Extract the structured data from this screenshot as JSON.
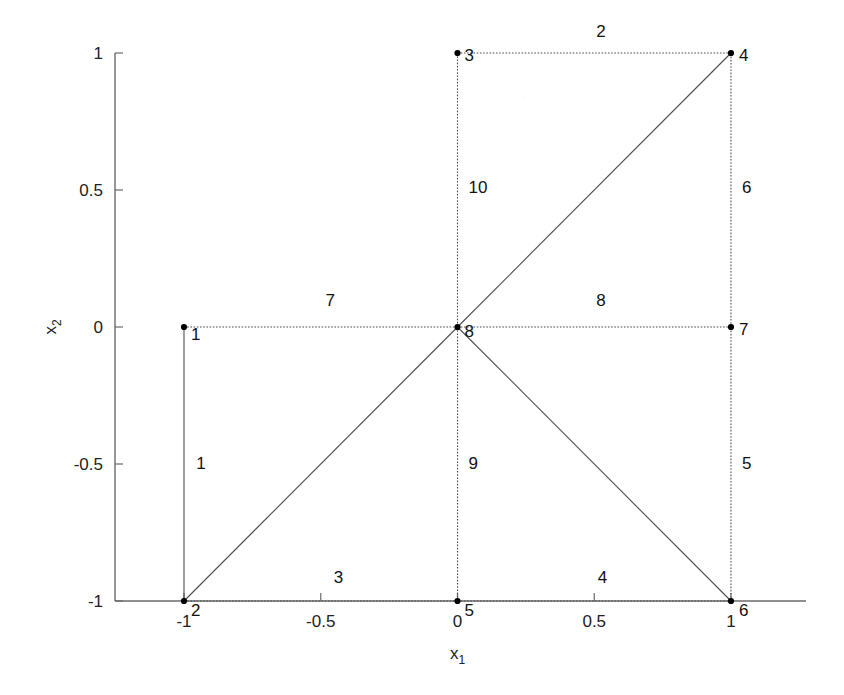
{
  "chart_data": {
    "type": "scatter",
    "title": "",
    "subtitle": "",
    "xlabel": "x_1",
    "ylabel": "x_2",
    "xlabel_base": "x",
    "xlabel_sub": "1",
    "ylabel_base": "x",
    "ylabel_sub": "2",
    "xlim": [
      -1.25,
      1.25
    ],
    "ylim": [
      -1.15,
      1.08
    ],
    "xticks": [
      -1,
      -0.5,
      0,
      0.5,
      1
    ],
    "xtick_labels": [
      "-1",
      "-0.5",
      "0",
      "0.5",
      "1"
    ],
    "yticks": [
      -1,
      -0.5,
      0,
      0.5,
      1
    ],
    "ytick_labels": [
      "-1",
      "-0.5",
      "0",
      "0.5",
      "1"
    ],
    "grid": false,
    "legend": "none",
    "nodes": [
      {
        "id": "1",
        "x": -1,
        "y": 0,
        "label": "1",
        "label_dx": 7,
        "label_dy": 13
      },
      {
        "id": "2",
        "x": -1,
        "y": -1,
        "label": "2",
        "label_dx": 7,
        "label_dy": 15
      },
      {
        "id": "3",
        "x": 0,
        "y": 1,
        "label": "3",
        "label_dx": 7,
        "label_dy": 8
      },
      {
        "id": "4",
        "x": 1,
        "y": 1,
        "label": "4",
        "label_dx": 8,
        "label_dy": 8
      },
      {
        "id": "5",
        "x": 0,
        "y": -1,
        "label": "5",
        "label_dx": 7,
        "label_dy": 15
      },
      {
        "id": "6",
        "x": 1,
        "y": -1,
        "label": "6",
        "label_dx": 8,
        "label_dy": 15
      },
      {
        "id": "7",
        "x": 1,
        "y": 0,
        "label": "7",
        "label_dx": 8,
        "label_dy": 8
      },
      {
        "id": "8",
        "x": 0,
        "y": 0,
        "label": "8",
        "label_dx": 7,
        "label_dy": 10
      }
    ],
    "edges": [
      {
        "label": "1",
        "from": "1",
        "to": "2",
        "style": "solid",
        "label_x": -0.955,
        "label_y": -0.52,
        "anchor": "start"
      },
      {
        "label": "2",
        "from": "3",
        "to": "4",
        "style": "dotted",
        "label_x": 0.525,
        "label_y": 1.06,
        "anchor": "middle"
      },
      {
        "label": "3",
        "from": "2",
        "to": "5",
        "style": "dotted",
        "label_x": -0.435,
        "label_y": -0.935,
        "anchor": "middle"
      },
      {
        "label": "4",
        "from": "5",
        "to": "6",
        "style": "dotted",
        "label_x": 0.53,
        "label_y": -0.935,
        "anchor": "middle"
      },
      {
        "label": "5",
        "from": "6",
        "to": "7",
        "style": "dotted",
        "label_x": 1.04,
        "label_y": -0.52,
        "anchor": "start"
      },
      {
        "label": "6",
        "from": "7",
        "to": "4",
        "style": "dotted",
        "label_x": 1.04,
        "label_y": 0.49,
        "anchor": "start"
      },
      {
        "label": "7",
        "from": "1",
        "to": "8",
        "style": "dotted",
        "label_x": -0.465,
        "label_y": 0.075,
        "anchor": "middle"
      },
      {
        "label": "8",
        "from": "8",
        "to": "7",
        "style": "dotted",
        "label_x": 0.525,
        "label_y": 0.075,
        "anchor": "middle"
      },
      {
        "label": "9",
        "from": "8",
        "to": "5",
        "style": "dotted",
        "label_x": 0.04,
        "label_y": -0.52,
        "anchor": "start"
      },
      {
        "label": "10",
        "from": "3",
        "to": "8",
        "style": "dotted",
        "label_x": 0.04,
        "label_y": 0.49,
        "anchor": "start"
      }
    ],
    "diagonals": [
      {
        "from": "2",
        "to": "8",
        "style": "solid"
      },
      {
        "from": "8",
        "to": "4",
        "style": "solid"
      },
      {
        "from": "8",
        "to": "6",
        "style": "solid"
      }
    ],
    "colors": {
      "background": "#ffffff",
      "edge": "#4d4d4d",
      "node": "#000000",
      "axis": "#6a6a6a",
      "text": "#1a1a1a"
    }
  }
}
